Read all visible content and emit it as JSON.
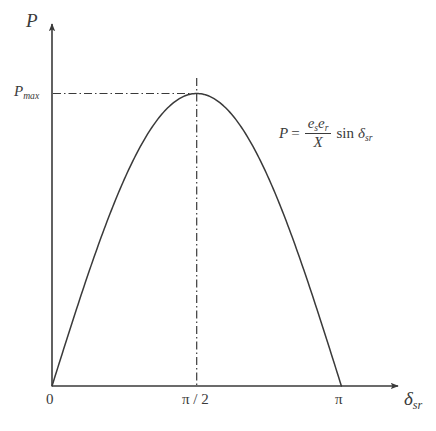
{
  "figure": {
    "kind": "line-plot",
    "background_color": "#ffffff",
    "ink_color": "#3a3a3a"
  },
  "axes": {
    "y_axis_title": "P",
    "x_axis_title_base": "δ",
    "x_axis_title_sub": "sr",
    "y_tick_label": "P",
    "y_tick_label_sub": "max",
    "x_tick_labels": [
      "0",
      "π / 2",
      "π"
    ],
    "origin_label": "0"
  },
  "equation": {
    "lhs": "P",
    "equals": "=",
    "numerator_1": "e",
    "numerator_1_sub": "s",
    "numerator_2": "e",
    "numerator_2_sub": "r",
    "denominator": "X",
    "function": "sin",
    "variable": "δ",
    "variable_sub": "sr",
    "plain": "P = (e_s e_r / X) sin δ_sr"
  },
  "guides": {
    "horizontal_style": "dash-dot",
    "vertical_style": "dash-dot",
    "peak_label": "P_max",
    "peak_x_label": "π / 2"
  },
  "chart_data": {
    "type": "line",
    "title": "",
    "xlabel": "δsr",
    "ylabel": "P",
    "xlim": [
      0,
      3.4557519
    ],
    "ylim": [
      0,
      1.18
    ],
    "grid": false,
    "legend": null,
    "x_tick_values": [
      0,
      1.5707963,
      3.1415927
    ],
    "x_tick_labels": [
      "0",
      "π / 2",
      "π"
    ],
    "y_tick_values": [
      1.0
    ],
    "y_tick_labels": [
      "Pmax"
    ],
    "annotations": [
      {
        "text": "P = (e_s e_r / X) sin δ_sr",
        "x": 2.1,
        "y": 0.82
      }
    ],
    "series": [
      {
        "name": "P = (es er / X) sin δsr",
        "formula": "sin(x)",
        "x": [
          0.0,
          0.15707963,
          0.31415927,
          0.4712389,
          0.62831853,
          0.78539816,
          0.9424778,
          1.09955743,
          1.25663706,
          1.41371669,
          1.57079633,
          1.72787596,
          1.88495559,
          2.04203522,
          2.19911486,
          2.35619449,
          2.51327412,
          2.67035376,
          2.82743339,
          2.98451302,
          3.14159265
        ],
        "y": [
          0.0,
          0.15643447,
          0.30901699,
          0.4539905,
          0.58778525,
          0.70710678,
          0.80901699,
          0.89100652,
          0.95105652,
          0.98768834,
          1.0,
          0.98768834,
          0.95105652,
          0.89100652,
          0.80901699,
          0.70710678,
          0.58778525,
          0.4539905,
          0.30901699,
          0.15643447,
          0.0
        ]
      }
    ]
  }
}
